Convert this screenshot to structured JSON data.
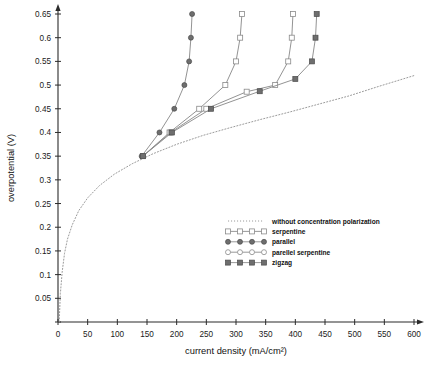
{
  "chart_data": {
    "type": "line",
    "title": "",
    "xlabel": "current density (mA/cm²)",
    "ylabel": "overpotential (V)",
    "xlim": [
      0,
      600
    ],
    "ylim": [
      0,
      0.65
    ],
    "xticks": [
      0,
      50,
      100,
      150,
      200,
      250,
      300,
      350,
      400,
      450,
      500,
      550,
      600
    ],
    "yticks": [
      0,
      0.05,
      0.1,
      0.15,
      0.2,
      0.25,
      0.3,
      0.35,
      0.4,
      0.45,
      0.5,
      0.55,
      0.6,
      0.65
    ],
    "xticklabels": [
      "0",
      "50",
      "100",
      "150",
      "200",
      "250",
      "300",
      "350",
      "400",
      "450",
      "500",
      "550",
      "600"
    ],
    "yticklabels": [
      "0",
      "0.05",
      "0.1",
      "0.15",
      "0.2",
      "0.25",
      "0.3",
      "0.35",
      "0.4",
      "0.45",
      "0.5",
      "0.55",
      "0.6",
      "0.65"
    ],
    "grid": false,
    "legend_position": "center-right",
    "series": [
      {
        "name": "without concentration polarization",
        "marker": "none",
        "linestyle": "dotted",
        "color": "#9a9a9a",
        "points": [
          [
            2,
            0.0
          ],
          [
            4,
            0.06
          ],
          [
            7,
            0.105
          ],
          [
            11,
            0.145
          ],
          [
            16,
            0.175
          ],
          [
            24,
            0.205
          ],
          [
            35,
            0.235
          ],
          [
            50,
            0.262
          ],
          [
            70,
            0.288
          ],
          [
            95,
            0.312
          ],
          [
            125,
            0.334
          ],
          [
            160,
            0.355
          ],
          [
            200,
            0.375
          ],
          [
            245,
            0.394
          ],
          [
            290,
            0.41
          ],
          [
            340,
            0.427
          ],
          [
            390,
            0.443
          ],
          [
            440,
            0.46
          ],
          [
            490,
            0.477
          ],
          [
            540,
            0.497
          ],
          [
            600,
            0.52
          ]
        ]
      },
      {
        "name": "serpentine",
        "marker": "open-square",
        "linestyle": "solid",
        "color": "#8d8d8d",
        "points": [
          [
            143,
            0.35
          ],
          [
            188,
            0.4
          ],
          [
            238,
            0.45
          ],
          [
            282,
            0.5
          ],
          [
            300,
            0.55
          ],
          [
            307,
            0.6
          ],
          [
            310,
            0.65
          ]
        ]
      },
      {
        "name": "parallel",
        "marker": "filled-circle",
        "linestyle": "solid",
        "color": "#6e6e6e",
        "points": [
          [
            141,
            0.35
          ],
          [
            171,
            0.4
          ],
          [
            196,
            0.45
          ],
          [
            213,
            0.5
          ],
          [
            221,
            0.55
          ],
          [
            224,
            0.6
          ],
          [
            226,
            0.65
          ]
        ]
      },
      {
        "name": "parellel serpentine",
        "marker": "open-square",
        "linestyle": "solid",
        "color": "#8d8d8d",
        "points": [
          [
            143,
            0.35
          ],
          [
            190,
            0.4
          ],
          [
            250,
            0.45
          ],
          [
            318,
            0.486
          ],
          [
            366,
            0.5
          ],
          [
            388,
            0.55
          ],
          [
            394,
            0.6
          ],
          [
            396,
            0.65
          ]
        ]
      },
      {
        "name": "zigzag",
        "marker": "filled-square",
        "linestyle": "solid",
        "color": "#6e6e6e",
        "points": [
          [
            143,
            0.35
          ],
          [
            192,
            0.4
          ],
          [
            258,
            0.45
          ],
          [
            340,
            0.487
          ],
          [
            400,
            0.513
          ],
          [
            428,
            0.55
          ],
          [
            434,
            0.6
          ],
          [
            436,
            0.65
          ]
        ]
      }
    ],
    "legend_entries": [
      {
        "label": "without concentration polarization",
        "marker": "none",
        "linestyle": "dotted"
      },
      {
        "label": "serpentine",
        "marker": "open-square",
        "linestyle": "solid"
      },
      {
        "label": "parallel",
        "marker": "filled-circle",
        "linestyle": "solid"
      },
      {
        "label": "parellel serpentine",
        "marker": "open-circle",
        "linestyle": "solid"
      },
      {
        "label": "zigzag",
        "marker": "filled-square",
        "linestyle": "solid"
      }
    ]
  }
}
